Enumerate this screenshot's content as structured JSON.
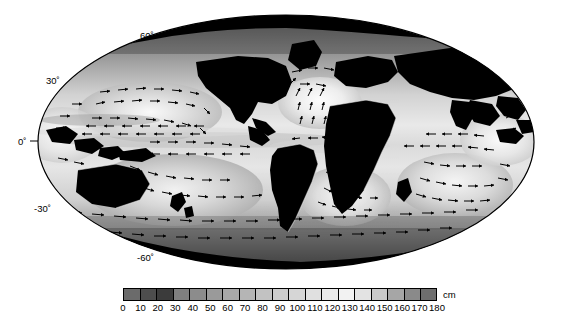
{
  "figure": {
    "type": "map-figure",
    "projection": "mollweide",
    "background_color": "#ffffff"
  },
  "map": {
    "name": "global-ocean-dynamic-topography-map",
    "land_color": "#000000",
    "ellipse": {
      "cx": 286,
      "cy": 142,
      "rx": 248,
      "ry": 127
    },
    "latitude_labels": [
      {
        "text": "60˚",
        "lat": 60,
        "x": 140,
        "y": 31
      },
      {
        "text": "30˚",
        "lat": 30,
        "x": 46,
        "y": 76
      },
      {
        "text": "0˚",
        "lat": 0,
        "x": 18,
        "y": 141
      },
      {
        "text": "-30˚",
        "lat": -30,
        "x": 40,
        "y": 208
      },
      {
        "text": "-60˚",
        "lat": -60,
        "x": 140,
        "y": 257
      }
    ],
    "has_tick_dash_at_equator": true,
    "vector_field": {
      "name": "ocean-current-arrows",
      "arrow_color": "#000000",
      "description": "geostrophic surface current vectors"
    }
  },
  "colorbar": {
    "name": "dynamic-topography-colorbar",
    "unit": "cm",
    "min": 0,
    "max": 180,
    "step": 10,
    "orientation": "horizontal",
    "ticks": [
      0,
      10,
      20,
      30,
      40,
      50,
      60,
      70,
      80,
      90,
      100,
      110,
      120,
      130,
      140,
      150,
      160,
      170,
      180
    ],
    "tick_labels": [
      "0",
      "10",
      "20",
      "30",
      "40",
      "50",
      "60",
      "70",
      "80",
      "90",
      "100",
      "110",
      "120",
      "130",
      "140",
      "150",
      "160",
      "170",
      "180"
    ],
    "swatches": [
      "#6b6b6b",
      "#4d4d4d",
      "#3b3b3b",
      "#7f7f7f",
      "#8c8c8c",
      "#9a9a9a",
      "#a8a8a8",
      "#b5b5b5",
      "#c2c2c2",
      "#cccccc",
      "#d6d6d6",
      "#e0e0e0",
      "#eaeaea",
      "#f2f2f2",
      "#e3e3e3",
      "#c9c9c9",
      "#a6a6a6",
      "#8a8a8a",
      "#6e6e6e"
    ]
  },
  "chart_data": {
    "type": "heatmap",
    "title": "",
    "xlabel": "",
    "ylabel": "",
    "unit": "cm",
    "projection": "mollweide",
    "colorbar_range": [
      0,
      180
    ],
    "colorbar_ticks": [
      0,
      10,
      20,
      30,
      40,
      50,
      60,
      70,
      80,
      90,
      100,
      110,
      120,
      130,
      140,
      150,
      160,
      170,
      180
    ],
    "latitude_ticks": [
      60,
      30,
      0,
      -30,
      -60
    ],
    "colormap": "grayscale",
    "overlay": "vector-arrows",
    "grid": false,
    "legend_position": "bottom"
  }
}
